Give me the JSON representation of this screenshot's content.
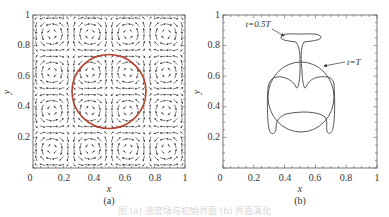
{
  "figure": {
    "caption": "图 (a) 速度场与初始界面  (b) 界面演化"
  },
  "chart_data": [
    {
      "type": "vector_field",
      "panel_label": "(a)",
      "title": "",
      "xlabel": "x",
      "ylabel": "y",
      "xlim": [
        0,
        1
      ],
      "ylim": [
        0,
        1
      ],
      "x_ticks": [
        "0",
        "0.2",
        "0.4",
        "0.6",
        "0.8",
        "1"
      ],
      "y_ticks": [
        "0",
        "0.2",
        "0.4",
        "0.6",
        "0.8",
        "1"
      ],
      "grid": false,
      "description": "Periodic vortex (swirling) velocity field, 4x4 cells of counter-rotating vortices drawn as black arrow streaks",
      "vortex_centers": [
        [
          0.125,
          0.125
        ],
        [
          0.375,
          0.125
        ],
        [
          0.625,
          0.125
        ],
        [
          0.875,
          0.125
        ],
        [
          0.125,
          0.375
        ],
        [
          0.375,
          0.375
        ],
        [
          0.625,
          0.375
        ],
        [
          0.875,
          0.375
        ],
        [
          0.125,
          0.625
        ],
        [
          0.375,
          0.625
        ],
        [
          0.625,
          0.625
        ],
        [
          0.875,
          0.625
        ],
        [
          0.125,
          0.875
        ],
        [
          0.375,
          0.875
        ],
        [
          0.625,
          0.875
        ],
        [
          0.875,
          0.875
        ]
      ],
      "overlay_circle": {
        "center": [
          0.5,
          0.5
        ],
        "radius": 0.25,
        "color": "#b5432f"
      }
    },
    {
      "type": "line",
      "panel_label": "(b)",
      "title": "",
      "xlabel": "x",
      "ylabel": "y",
      "xlim": [
        0,
        1
      ],
      "ylim": [
        0,
        1
      ],
      "x_ticks": [
        "0",
        "0.2",
        "0.4",
        "0.6",
        "0.8",
        "1"
      ],
      "y_ticks": [
        "0",
        "0.2",
        "0.4",
        "0.6",
        "0.8",
        "1"
      ],
      "grid": false,
      "series": [
        {
          "name": "t=0.5T",
          "description": "Deformed interface: mushroom/T-shaped top cap at y≈0.85 spanning x≈0.38–0.62, thin stem down to y≈0.5, lateral arms reaching down to y≈0.2 at x≈0.28 and x≈0.72"
        },
        {
          "name": "t=T",
          "description": "Interface returned to near-circular shape centered (0.5,0.5), radius ≈0.2"
        }
      ],
      "annotations": [
        {
          "text": "t=0.5T",
          "x": 0.24,
          "y": 0.92,
          "arrow_to": [
            0.38,
            0.85
          ]
        },
        {
          "text": "t=T",
          "x": 0.78,
          "y": 0.69,
          "arrow_to": [
            0.65,
            0.66
          ]
        }
      ]
    }
  ]
}
